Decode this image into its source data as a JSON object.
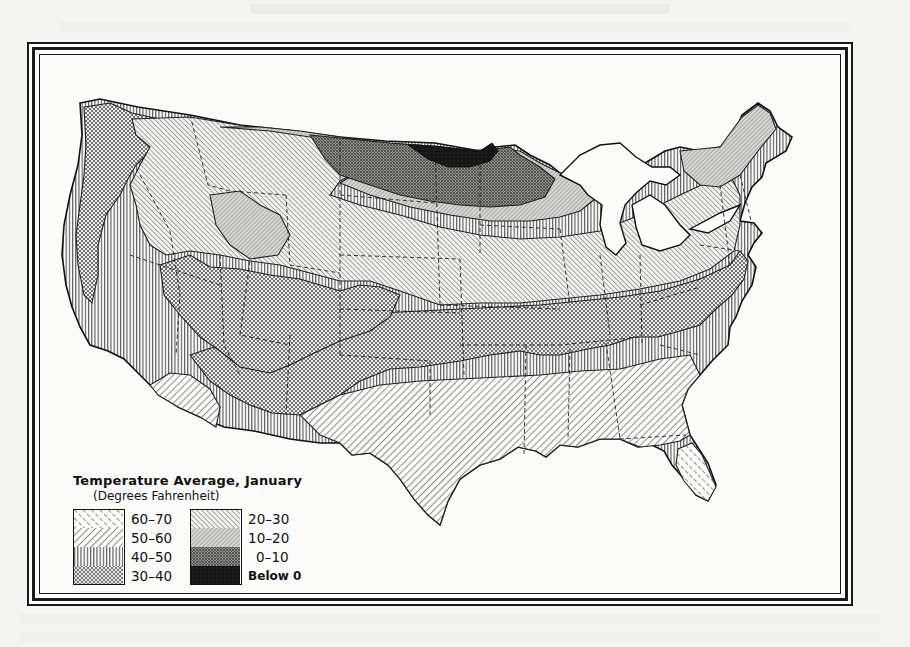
{
  "page": {
    "background_color": "#f4f4f2",
    "ink_color": "#111111"
  },
  "map": {
    "subject": "United States — January average temperature zones",
    "region_fills": {
      "60-70": "p6070",
      "50-60": "p5060",
      "40-50": "p4050",
      "30-40": "p3040",
      "20-30": "p2030",
      "10-20": "p1020",
      "0-10": "p0010",
      "below-0": "pbelow"
    }
  },
  "legend": {
    "title": "Temperature Average, January",
    "subtitle": "(Degrees Fahrenheit)",
    "column_left": [
      {
        "label": "60–70",
        "pattern": "diagonal-dashed-forward"
      },
      {
        "label": "50–60",
        "pattern": "diagonal-back"
      },
      {
        "label": "40–50",
        "pattern": "vertical-lines"
      },
      {
        "label": "30–40",
        "pattern": "crosshatch-fine"
      }
    ],
    "column_right": [
      {
        "label": "20–30",
        "pattern": "diagonal-forward-dense"
      },
      {
        "label": "10–20",
        "pattern": "diagonal-back-dense"
      },
      {
        "label": "0–10",
        "pattern": "dark-crosshatch"
      },
      {
        "label": "Below 0",
        "pattern": "solid-black"
      }
    ]
  }
}
